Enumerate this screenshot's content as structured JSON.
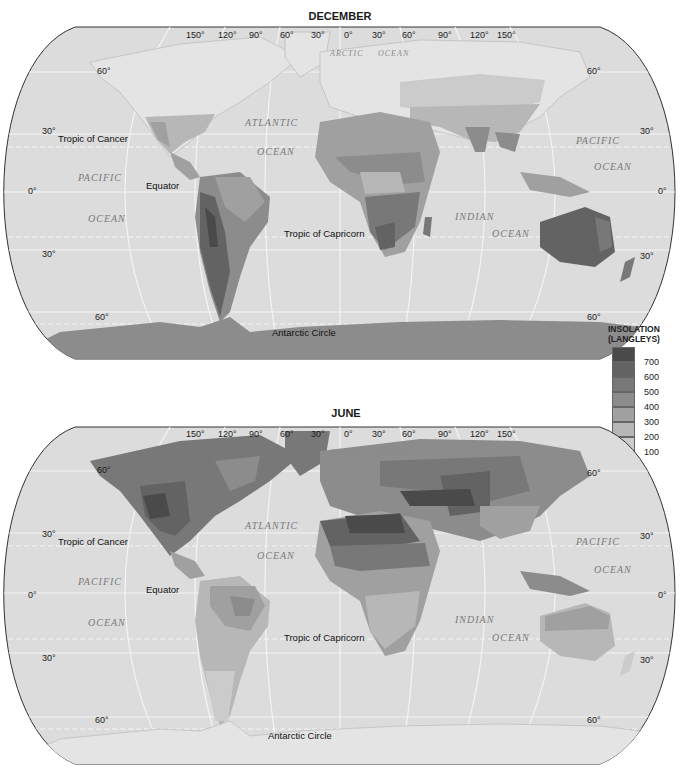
{
  "maps": [
    {
      "id": "december",
      "title": "DECEMBER",
      "longitude_labels": [
        "150°",
        "120°",
        "90°",
        "60°",
        "30°",
        "0°",
        "30°",
        "60°",
        "90°",
        "120°",
        "150°"
      ],
      "latitude_labels_left": [
        "60°",
        "30°",
        "0°",
        "30°",
        "60°"
      ],
      "latitude_labels_right": [
        "60°",
        "30°",
        "0°",
        "30°",
        "60°"
      ],
      "line_labels": {
        "tropic_cancer": "Tropic of Cancer",
        "equator": "Equator",
        "tropic_capricorn": "Tropic of Capricorn",
        "antarctic_circle": "Antarctic Circle"
      },
      "ocean_labels": {
        "arctic": "ARCTIC",
        "arctic2": "OCEAN",
        "atlantic": "ATLANTIC",
        "atlantic2": "OCEAN",
        "pacific_w": "PACIFIC",
        "pacific_w2": "OCEAN",
        "pacific_e": "PACIFIC",
        "pacific_e2": "OCEAN",
        "indian": "INDIAN",
        "indian2": "OCEAN"
      }
    },
    {
      "id": "june",
      "title": "JUNE",
      "longitude_labels": [
        "150°",
        "120°",
        "90°",
        "60°",
        "30°",
        "0°",
        "30°",
        "60°",
        "90°",
        "120°",
        "150°"
      ],
      "latitude_labels_left": [
        "60°",
        "30°",
        "0°",
        "30°",
        "60°"
      ],
      "latitude_labels_right": [
        "60°",
        "30°",
        "0°",
        "30°",
        "60°"
      ],
      "line_labels": {
        "tropic_cancer": "Tropic of Cancer",
        "equator": "Equator",
        "tropic_capricorn": "Tropic of Capricorn",
        "antarctic_circle": "Antarctic Circle"
      },
      "ocean_labels": {
        "arctic": "ARCTIC",
        "arctic2": "OCEAN",
        "atlantic": "ATLANTIC",
        "atlantic2": "OCEAN",
        "pacific_w": "PACIFIC",
        "pacific_w2": "OCEAN",
        "pacific_e": "PACIFIC",
        "pacific_e2": "OCEAN",
        "indian": "INDIAN",
        "indian2": "OCEAN"
      }
    }
  ],
  "legend": {
    "title_line1": "INSOLATION",
    "title_line2": "(LANGLEYS)",
    "boundaries": [
      "700",
      "600",
      "500",
      "400",
      "300",
      "200",
      "100"
    ],
    "colors": [
      "#4a4a4a",
      "#636363",
      "#787878",
      "#8c8c8c",
      "#a0a0a0",
      "#b7b7b7",
      "#cbcbcb",
      "#e4e4e4"
    ]
  },
  "colors": {
    "ocean": "#dcdcdc",
    "grid": "#f4f4f4",
    "border": "#333333"
  }
}
